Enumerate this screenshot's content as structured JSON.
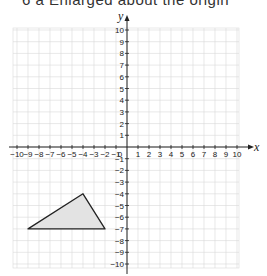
{
  "header": {
    "cut_text": "6  a  Enlarged about the origin"
  },
  "chart_data": {
    "type": "scatter",
    "title": "",
    "xlabel": "x",
    "ylabel": "y",
    "xlim": [
      -10,
      10
    ],
    "ylim": [
      -10,
      10
    ],
    "grid": true,
    "x_ticks": [
      -10,
      -9,
      -8,
      -7,
      -6,
      -5,
      -4,
      -3,
      -2,
      -1,
      0,
      1,
      2,
      3,
      4,
      5,
      6,
      7,
      8,
      9,
      10
    ],
    "y_ticks": [
      -10,
      -9,
      -8,
      -7,
      -6,
      -5,
      -4,
      -3,
      -2,
      -1,
      1,
      2,
      3,
      4,
      5,
      6,
      7,
      8,
      9,
      10
    ],
    "shapes": [
      {
        "name": "triangle",
        "vertices": [
          [
            -4,
            -4
          ],
          [
            -9,
            -7
          ],
          [
            -2,
            -7
          ]
        ],
        "fill": "#e3e3e3",
        "stroke": "#222222"
      }
    ]
  },
  "colors": {
    "grid": "#d9d9d9",
    "axis": "#222222",
    "shape_fill": "#e3e3e3"
  }
}
